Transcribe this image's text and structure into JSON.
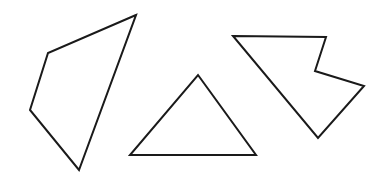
{
  "canvas": {
    "width": 388,
    "height": 178,
    "background_color": "#ffffff",
    "stroke_color": "#1a1a1a",
    "fill_color": "#ffffff",
    "stroke_width": 2
  },
  "figure": {
    "title": "",
    "shape_count": 3
  },
  "shapes": [
    {
      "id": "shape-left-quadrilateral",
      "name": "quadrilateral",
      "label": "Left quadrilateral (kite-like, 4 sides)",
      "sides": 4,
      "convex": true,
      "points": "136,15 48,53 30,110 79,170",
      "vertices": [
        {
          "x": 136,
          "y": 15
        },
        {
          "x": 48,
          "y": 53
        },
        {
          "x": 30,
          "y": 110
        },
        {
          "x": 79,
          "y": 170
        }
      ]
    },
    {
      "id": "shape-middle-triangle",
      "name": "triangle",
      "label": "Middle triangle (3 sides)",
      "sides": 3,
      "convex": true,
      "points": "198,75 256,155 130,155",
      "vertices": [
        {
          "x": 198,
          "y": 75
        },
        {
          "x": 256,
          "y": 155
        },
        {
          "x": 130,
          "y": 155
        }
      ]
    },
    {
      "id": "shape-right-arrow",
      "name": "concave-arrow-polygon",
      "label": "Right concave arrow polygon (6 sides)",
      "sides": 6,
      "convex": false,
      "points": "233,36 326,37 315,71 364,86 318,138 233,36",
      "vertices": [
        {
          "x": 233,
          "y": 36
        },
        {
          "x": 326,
          "y": 37
        },
        {
          "x": 315,
          "y": 71
        },
        {
          "x": 364,
          "y": 86
        },
        {
          "x": 318,
          "y": 138
        }
      ]
    }
  ]
}
